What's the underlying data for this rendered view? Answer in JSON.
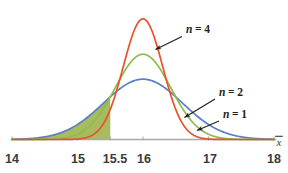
{
  "chart_data": {
    "type": "line",
    "title": "",
    "subtitle": "",
    "xlabel": "x̄",
    "ylabel": "",
    "xlim": [
      14,
      18
    ],
    "ylim": [
      0,
      1.45
    ],
    "grid": false,
    "legend_position": "inline-annotations",
    "x_ticks": [
      {
        "value": 14,
        "label": "14"
      },
      {
        "value": 15,
        "label": "15"
      },
      {
        "value": 15.5,
        "label": "15.5"
      },
      {
        "value": 16,
        "label": "16"
      },
      {
        "value": 17,
        "label": "17"
      },
      {
        "value": 18,
        "label": "18"
      }
    ],
    "center": 16,
    "series": [
      {
        "name": "n = 1",
        "label": "n = 1",
        "color": "#5b7fc7",
        "mean": 16,
        "sd": 0.6,
        "peak_height": 0.665,
        "distribution": "normal"
      },
      {
        "name": "n = 2",
        "label": "n = 2",
        "color": "#8fbc4a",
        "mean": 16,
        "sd": 0.424,
        "peak_height": 0.94,
        "distribution": "normal"
      },
      {
        "name": "n = 4",
        "label": "n = 4",
        "color": "#e8512a",
        "mean": 16,
        "sd": 0.3,
        "peak_height": 1.33,
        "distribution": "normal"
      }
    ],
    "shaded_region": {
      "label": "",
      "from": 14,
      "to": 15.5,
      "color": "#9aaf43",
      "opacity": 0.85
    },
    "annotations": [
      {
        "text": "n = 4",
        "var": "n",
        "value": "4",
        "points_to": "n = 4 curve"
      },
      {
        "text": "n = 2",
        "var": "n",
        "value": "2",
        "points_to": "n = 2 curve"
      },
      {
        "text": "n = 1",
        "var": "n",
        "value": "1",
        "points_to": "n = 1 curve"
      }
    ],
    "axis_color": "#a8a8a6",
    "annotation_color": "#231f20"
  },
  "figure": {
    "axis_label": "x̄",
    "tick_14": "14",
    "tick_15": "15",
    "tick_155": "15.5",
    "tick_16": "16",
    "tick_17": "17",
    "tick_18": "18",
    "label_n4_var": "n",
    "label_n4_rest": "= 4",
    "label_n2_var": "n",
    "label_n2_rest": "= 2",
    "label_n1_var": "n",
    "label_n1_rest": "= 1"
  }
}
